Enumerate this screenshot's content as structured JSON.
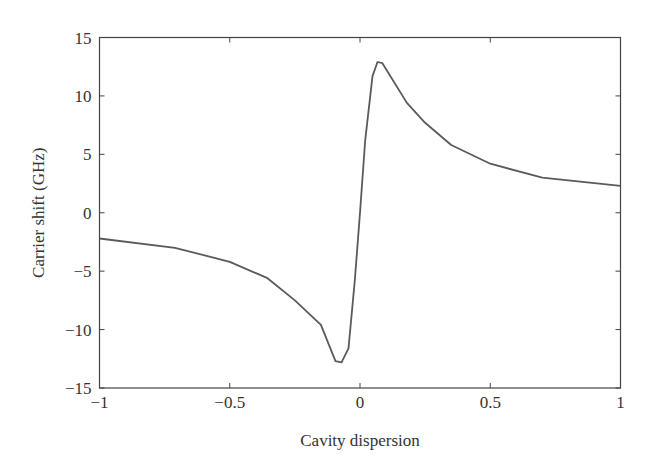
{
  "chart_data": {
    "type": "line",
    "title": "",
    "xlabel": "Cavity dispersion",
    "ylabel": "Carrier shift (GHz)",
    "xlim": [
      -1,
      1
    ],
    "ylim": [
      -15,
      15
    ],
    "xticks": [
      -1,
      -0.5,
      0,
      0.5,
      1
    ],
    "xtick_labels": [
      "−1",
      "−0.5",
      "0",
      "0.5",
      "1"
    ],
    "yticks": [
      15,
      10,
      5,
      0,
      -5,
      -10,
      -15
    ],
    "ytick_labels": [
      "15",
      "10",
      "5",
      "0",
      "−5",
      "−10",
      "−15"
    ],
    "grid": false,
    "legend": null,
    "line_color": "#5a5a5a",
    "series": [
      {
        "name": "Carrier shift",
        "x": [
          -1.0,
          -0.71,
          -0.5,
          -0.355,
          -0.25,
          -0.15,
          -0.094,
          -0.071,
          -0.044,
          -0.02,
          0.0,
          0.02,
          0.048,
          0.067,
          0.086,
          0.18,
          0.25,
          0.35,
          0.5,
          0.7,
          1.0
        ],
        "y": [
          -2.2,
          -3.0,
          -4.2,
          -5.6,
          -7.5,
          -9.6,
          -12.7,
          -12.8,
          -11.6,
          -5.8,
          0.0,
          6.2,
          11.7,
          12.9,
          12.8,
          9.4,
          7.7,
          5.8,
          4.2,
          3.0,
          2.3
        ]
      }
    ]
  }
}
